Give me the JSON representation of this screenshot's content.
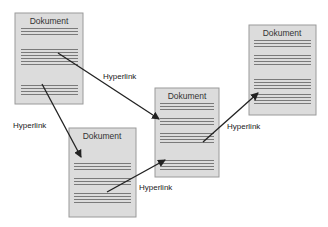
{
  "diagram": {
    "type": "hypertext-document-network",
    "documents": [
      {
        "id": "doc1",
        "title": "Dokument",
        "x": 15,
        "y": 13,
        "w": 68,
        "h": 91,
        "line_groups": [
          [
            27,
            3
          ],
          [
            49,
            6
          ],
          [
            83,
            4
          ]
        ]
      },
      {
        "id": "doc2",
        "title": "Dokument",
        "x": 69,
        "y": 128,
        "w": 67,
        "h": 89,
        "line_groups": [
          [
            162,
            3
          ],
          [
            177,
            3
          ],
          [
            191,
            4
          ]
        ]
      },
      {
        "id": "doc3",
        "title": "Dokument",
        "x": 155,
        "y": 88,
        "w": 64,
        "h": 89,
        "line_groups": [
          [
            103,
            3
          ],
          [
            117,
            3
          ],
          [
            131,
            4
          ],
          [
            158,
            4
          ]
        ]
      },
      {
        "id": "doc4",
        "title": "Dokument",
        "x": 249,
        "y": 25,
        "w": 67,
        "h": 90,
        "line_groups": [
          [
            40,
            3
          ],
          [
            54,
            4
          ],
          [
            79,
            4
          ],
          [
            93,
            4
          ]
        ]
      }
    ],
    "links": [
      {
        "from": "doc1",
        "to": "doc3",
        "label": "Hyperlink",
        "x1": 58,
        "y1": 53,
        "x2": 159,
        "y2": 119,
        "lx": 103,
        "ly": 79
      },
      {
        "from": "doc1",
        "to": "doc2",
        "label": "Hyperlink",
        "x1": 42,
        "y1": 84,
        "x2": 81,
        "y2": 157,
        "lx": 13,
        "ly": 128
      },
      {
        "from": "doc2",
        "to": "doc3",
        "label": "Hyperlink",
        "x1": 107,
        "y1": 192,
        "x2": 165,
        "y2": 160,
        "lx": 139,
        "ly": 190
      },
      {
        "from": "doc3",
        "to": "doc4",
        "label": "Hyperlink",
        "x1": 203,
        "y1": 142,
        "x2": 258,
        "y2": 93,
        "lx": 227,
        "ly": 129
      }
    ]
  },
  "labels": {
    "doc1_title": "Dokument",
    "doc2_title": "Dokument",
    "doc3_title": "Dokument",
    "doc4_title": "Dokument",
    "link1": "Hyperlink",
    "link2": "Hyperlink",
    "link3": "Hyperlink",
    "link4": "Hyperlink"
  }
}
